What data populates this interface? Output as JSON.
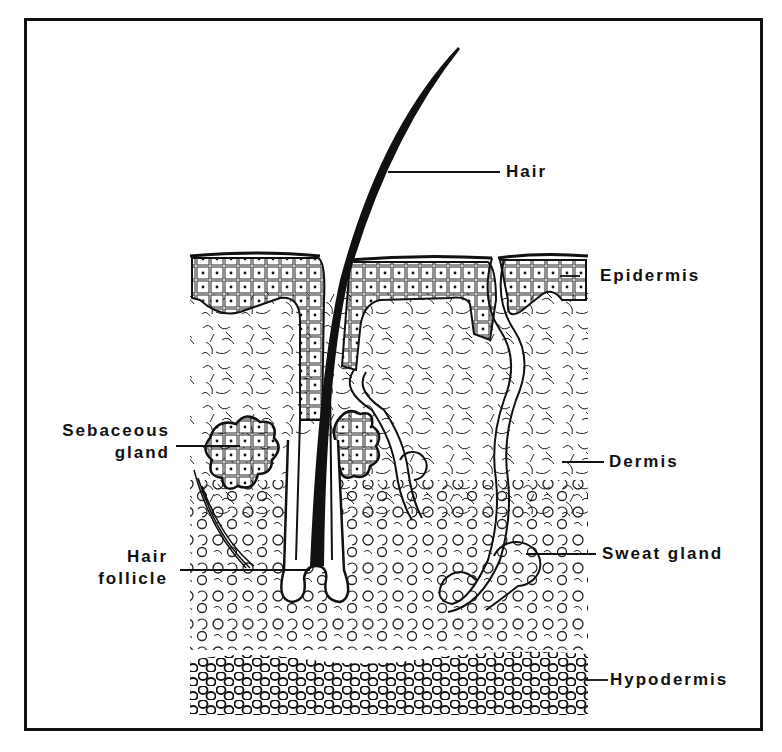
{
  "diagram": {
    "colors": {
      "ink": "#111111",
      "background": "#ffffff"
    },
    "labels": [
      {
        "id": "hair",
        "text": "Hair"
      },
      {
        "id": "epidermis",
        "text": "Epidermis"
      },
      {
        "id": "sebaceous_gland",
        "line1": "Sebaceous",
        "line2": "gland"
      },
      {
        "id": "dermis",
        "text": "Dermis"
      },
      {
        "id": "hair_follicle",
        "line1": "Hair",
        "line2": "follicle"
      },
      {
        "id": "sweat_gland",
        "text": "Sweat gland"
      },
      {
        "id": "hypodermis",
        "text": "Hypodermis"
      }
    ]
  }
}
